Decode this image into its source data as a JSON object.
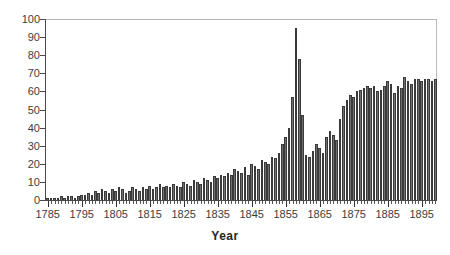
{
  "chart_data": {
    "type": "bar",
    "title": "",
    "subtitle": "",
    "xlabel": "Year",
    "ylabel": "",
    "ylim": [
      0,
      100
    ],
    "xlim": [
      1784.5,
      1899.5
    ],
    "y_ticks": [
      0,
      10,
      20,
      30,
      40,
      50,
      60,
      70,
      80,
      90,
      100
    ],
    "x_ticks": [
      1785,
      1795,
      1805,
      1815,
      1825,
      1835,
      1845,
      1855,
      1865,
      1875,
      1885,
      1895
    ],
    "x_minor_tick_step": 1,
    "grid": false,
    "legend": null,
    "legend_position": "none",
    "bar_color": "#6e6e6e",
    "bar_edge_color": "#3a3a3a",
    "axis_color": "#4a4a4a",
    "frame_color": "#b9b9b9",
    "annotations": [],
    "categories": [
      1785,
      1786,
      1787,
      1788,
      1789,
      1790,
      1791,
      1792,
      1793,
      1794,
      1795,
      1796,
      1797,
      1798,
      1799,
      1800,
      1801,
      1802,
      1803,
      1804,
      1805,
      1806,
      1807,
      1808,
      1809,
      1810,
      1811,
      1812,
      1813,
      1814,
      1815,
      1816,
      1817,
      1818,
      1819,
      1820,
      1821,
      1822,
      1823,
      1824,
      1825,
      1826,
      1827,
      1828,
      1829,
      1830,
      1831,
      1832,
      1833,
      1834,
      1835,
      1836,
      1837,
      1838,
      1839,
      1840,
      1841,
      1842,
      1843,
      1844,
      1845,
      1846,
      1847,
      1848,
      1849,
      1850,
      1851,
      1852,
      1853,
      1854,
      1855,
      1856,
      1857,
      1858,
      1859,
      1860,
      1861,
      1862,
      1863,
      1864,
      1865,
      1866,
      1867,
      1868,
      1869,
      1870,
      1871,
      1872,
      1873,
      1874,
      1875,
      1876,
      1877,
      1878,
      1879,
      1880,
      1881,
      1882,
      1883,
      1884,
      1885,
      1886,
      1887,
      1888,
      1889,
      1890,
      1891,
      1892,
      1893,
      1894,
      1895,
      1896,
      1897,
      1898,
      1899
    ],
    "values": [
      1,
      1,
      1,
      1,
      2,
      1,
      2,
      2,
      1,
      2,
      3,
      3,
      4,
      3,
      5,
      4,
      6,
      5,
      4,
      6,
      5,
      7,
      6,
      4,
      5,
      7,
      6,
      5,
      7,
      6,
      8,
      6,
      7,
      9,
      7,
      8,
      7,
      9,
      8,
      7,
      10,
      9,
      8,
      11,
      10,
      9,
      12,
      11,
      10,
      13,
      12,
      14,
      13,
      15,
      14,
      17,
      16,
      15,
      18,
      14,
      20,
      19,
      17,
      22,
      21,
      20,
      24,
      23,
      26,
      31,
      35,
      40,
      57,
      95,
      78,
      47,
      25,
      24,
      27,
      31,
      29,
      26,
      35,
      38,
      36,
      33,
      45,
      52,
      55,
      58,
      57,
      60,
      61,
      62,
      63,
      62,
      63,
      60,
      61,
      63,
      66,
      64,
      59,
      63,
      62,
      68,
      66,
      64,
      67,
      67,
      66,
      67,
      67,
      66,
      67
    ]
  }
}
